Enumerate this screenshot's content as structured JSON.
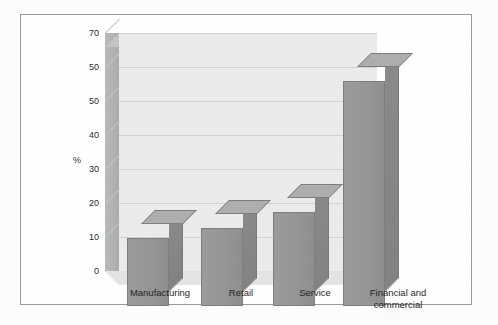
{
  "chart_data": {
    "type": "bar",
    "title": "",
    "xlabel": "",
    "ylabel": "%",
    "categories": [
      "Manufacturing",
      "Retail",
      "Service",
      "Financial and commercial"
    ],
    "values": [
      21,
      24,
      29,
      69
    ],
    "ylim": [
      0,
      75
    ],
    "ytick_labels": [
      "70",
      "50",
      "50",
      "40",
      "30",
      "20",
      "10",
      "0"
    ],
    "ytick_positions": [
      70,
      60,
      50,
      40,
      30,
      20,
      10,
      0
    ],
    "grid": true,
    "legend": "none",
    "style": "3d-grayscale",
    "series": [
      {
        "name": "Percentage",
        "values": [
          21,
          24,
          29,
          69
        ]
      }
    ]
  },
  "axes": {
    "y_caption": "%",
    "ticks": [
      {
        "label": "70",
        "value": 70
      },
      {
        "label": "50",
        "value": 60
      },
      {
        "label": "50",
        "value": 50
      },
      {
        "label": "40",
        "value": 40
      },
      {
        "label": "30",
        "value": 30
      },
      {
        "label": "20",
        "value": 20
      },
      {
        "label": "10",
        "value": 10
      },
      {
        "label": "0",
        "value": 0
      }
    ]
  },
  "categories": [
    {
      "line1": "Manufacturing",
      "line2": ""
    },
    {
      "line1": "Retail",
      "line2": ""
    },
    {
      "line1": "Service",
      "line2": ""
    },
    {
      "line1": "Financial and",
      "line2": "commercial"
    }
  ],
  "colors": {
    "bar_front": "#969696",
    "bar_side": "#858585",
    "bar_top": "#aeaeae",
    "plot_background": "#ebebeb",
    "gridline": "#d2d2d2",
    "border": "#9a9a9a",
    "page_background": "#fcfcfc",
    "text": "#1f1f1f"
  }
}
